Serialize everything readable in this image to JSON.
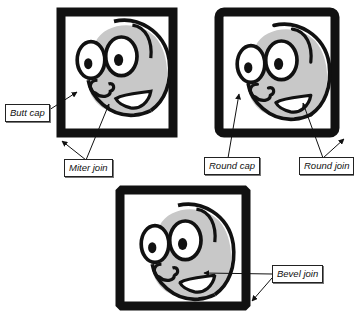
{
  "diagram": {
    "title": "",
    "colors": {
      "stroke": "#111111",
      "face_fill": "#c8c8c8",
      "background": "#ffffff"
    },
    "panels": [
      {
        "id": "panel-miter",
        "join": "miter",
        "cap": "butt"
      },
      {
        "id": "panel-round",
        "join": "round",
        "cap": "round"
      },
      {
        "id": "panel-bevel",
        "join": "bevel",
        "cap": "butt"
      }
    ],
    "labels": {
      "butt_cap": "Butt cap",
      "miter_join": "Miter join",
      "round_cap": "Round cap",
      "round_join": "Round join",
      "bevel_join": "Bevel join"
    }
  }
}
